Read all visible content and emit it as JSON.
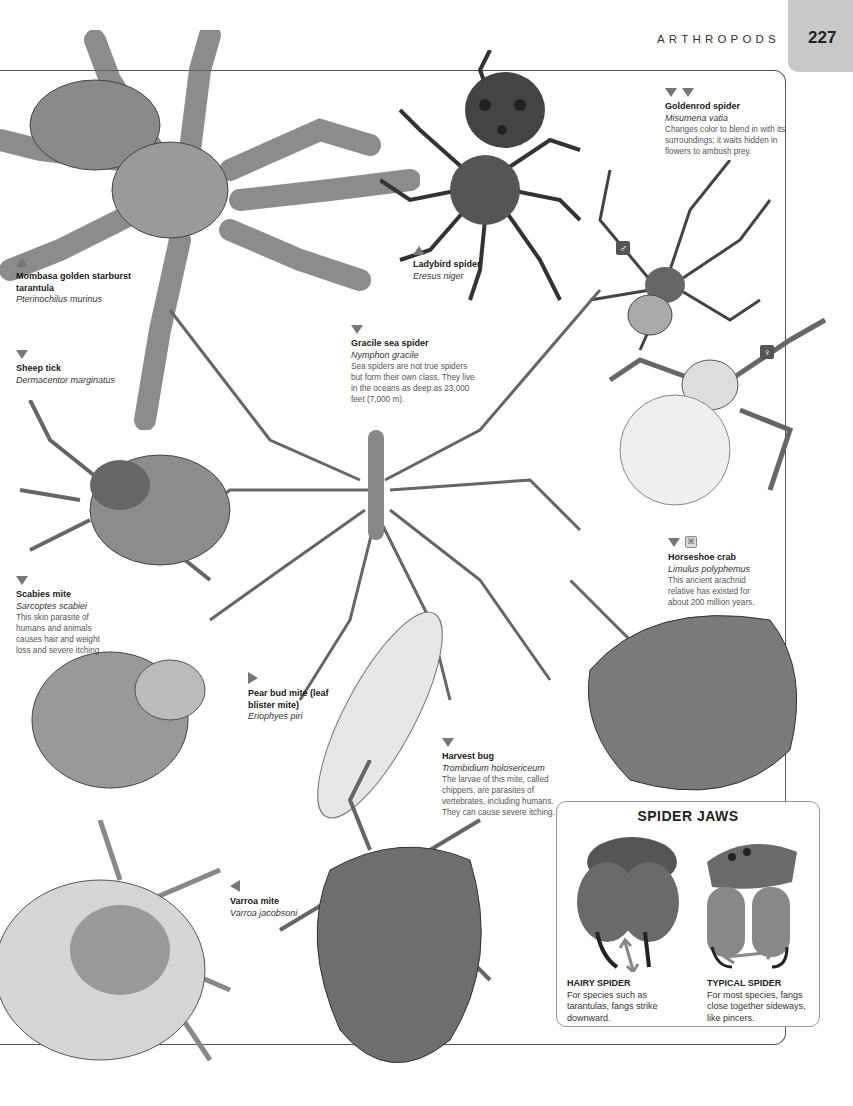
{
  "header": {
    "section_title": "ARTHROPODS",
    "page_number": "227",
    "tab_color": "#c8c8c8"
  },
  "species": [
    {
      "id": "mombasa",
      "arrow": "up",
      "common": "Mombasa golden starburst tarantula",
      "latin": "Pterinochilus murinus",
      "desc": ""
    },
    {
      "id": "sheep-tick",
      "arrow": "down",
      "common": "Sheep tick",
      "latin": "Dermacentor marginatus",
      "desc": ""
    },
    {
      "id": "ladybird",
      "arrow": "up",
      "common": "Ladybird spider",
      "latin": "Eresus niger",
      "desc": ""
    },
    {
      "id": "goldenrod",
      "arrow": "down-down",
      "common": "Goldenrod spider",
      "latin": "Misumena vatia",
      "desc": "Changes color to blend in with its surroundings; it waits hidden in flowers to ambush prey."
    },
    {
      "id": "gracile",
      "arrow": "down",
      "common": "Gracile sea spider",
      "latin": "Nymphon gracile",
      "desc": "Sea spiders are not true spiders but form their own class. They live in the oceans as deep as 23,000 feet (7,000 m)."
    },
    {
      "id": "scabies",
      "arrow": "down",
      "common": "Scabies mite",
      "latin": "Sarcoptes scabiei",
      "desc": "This skin parasite of humans and animals causes hair and weight loss and severe itching."
    },
    {
      "id": "horseshoe",
      "arrow": "down",
      "common": "Horseshoe crab",
      "latin": "Limulus polyphemus",
      "desc": "This ancient arachnid relative has existed for about 200 million years."
    },
    {
      "id": "pear-bud",
      "arrow": "right",
      "common": "Pear bud mite (leaf blister mite)",
      "latin": "Eriophyes piri",
      "desc": ""
    },
    {
      "id": "harvest",
      "arrow": "down",
      "common": "Harvest bug",
      "latin": "Trombidium holosericeum",
      "desc": "The larvae of this mite, called chippers, are parasites of vertebrates, including humans. They can cause severe itching."
    },
    {
      "id": "varroa",
      "arrow": "left",
      "common": "Varroa mite",
      "latin": "Varroa jacobsoni",
      "desc": ""
    }
  ],
  "sex_badges": {
    "male": "♂",
    "female": "♀"
  },
  "fossil_icon": "⌘",
  "spider_jaws": {
    "title": "SPIDER JAWS",
    "hairy": {
      "heading": "HAIRY SPIDER",
      "text": "For species such as tarantulas, fangs strike downward."
    },
    "typical": {
      "heading": "TYPICAL SPIDER",
      "text": "For most species, fangs close together sideways, like pincers."
    },
    "arrow_color": "#888888"
  }
}
